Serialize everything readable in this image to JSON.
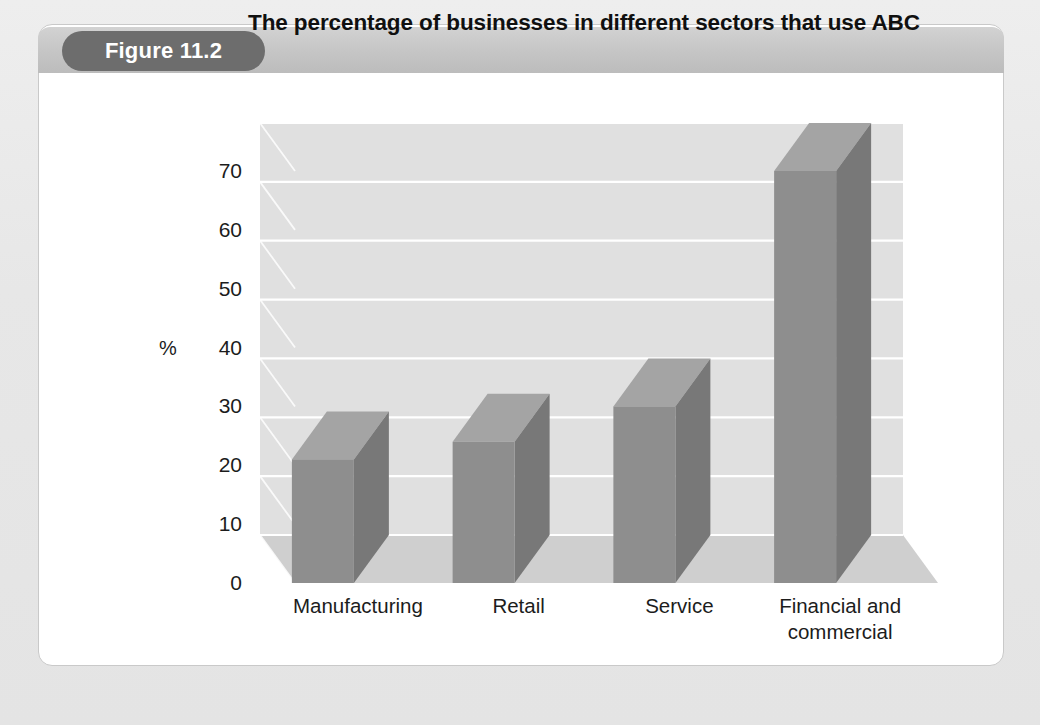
{
  "figure": {
    "badge_label": "Figure 11.2",
    "title": "The percentage of businesses in different sectors that use ABC"
  },
  "colors": {
    "page_background": "#e9e9e9",
    "card_background": "#ffffff",
    "card_border": "#c9c9c9",
    "header_band": "#c5c5c5",
    "badge_background": "#6d6d6d",
    "badge_text": "#ffffff",
    "title_text": "#101010",
    "bar_front": "#8e8e8e",
    "bar_side": "#787878",
    "bar_top": "#a4a4a4",
    "wall_back": "#e0e0e0",
    "wall_side": "#c4c4c4",
    "floor": "#cfcfcf",
    "gridline": "#ffffff",
    "axis_text": "#1c1c1c"
  },
  "chart_data": {
    "type": "bar",
    "title": "The percentage of businesses in different sectors that use ABC",
    "subtitle": "",
    "xlabel": "",
    "ylabel": "%",
    "categories": [
      "Manufacturing",
      "Retail",
      "Service",
      "Financial and commercial"
    ],
    "category_lines": [
      [
        "Manufacturing"
      ],
      [
        "Retail"
      ],
      [
        "Service"
      ],
      [
        "Financial and",
        "commercial"
      ]
    ],
    "values": [
      21,
      24,
      30,
      70
    ],
    "ylim": [
      0,
      70
    ],
    "ytick_labels": [
      "0",
      "10",
      "20",
      "30",
      "40",
      "50",
      "60",
      "70"
    ],
    "ytick_values": [
      0,
      10,
      20,
      30,
      40,
      50,
      60,
      70
    ],
    "grid": true,
    "legend": false,
    "legend_position": "none",
    "style": "3d-column",
    "annotations": []
  }
}
